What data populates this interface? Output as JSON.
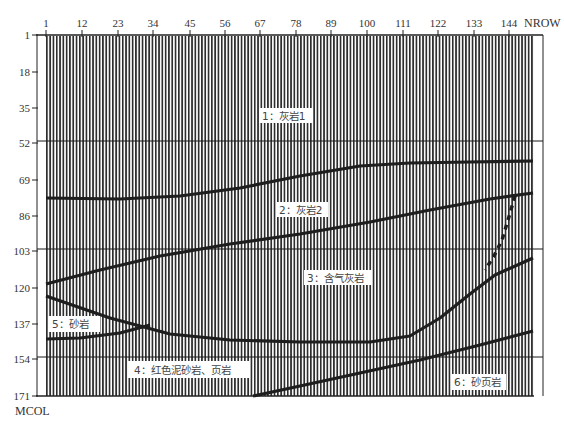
{
  "figure": {
    "column_axis_name": "NROW",
    "row_axis_name": "MCOL",
    "column_ticks": [
      "1",
      "12",
      "23",
      "34",
      "45",
      "56",
      "67",
      "78",
      "89",
      "100",
      "111",
      "122",
      "133",
      "144"
    ],
    "row_ticks": [
      "1",
      "18",
      "35",
      "52",
      "69",
      "86",
      "103",
      "120",
      "137",
      "154",
      "171"
    ],
    "layers": [
      {
        "id": "1",
        "label": "1：灰岩1"
      },
      {
        "id": "2",
        "label": "2：灰岩2"
      },
      {
        "id": "3",
        "label": "3：含气灰岩"
      },
      {
        "id": "4",
        "label": "4：红色泥砂岩、页岩"
      },
      {
        "id": "5",
        "label": "5：砂岩"
      },
      {
        "id": "6",
        "label": "6：砂页岩"
      }
    ],
    "colors": {
      "trace": "#2a2a2a",
      "background": "#ffffff",
      "boundary": "#1a1a1a"
    }
  }
}
